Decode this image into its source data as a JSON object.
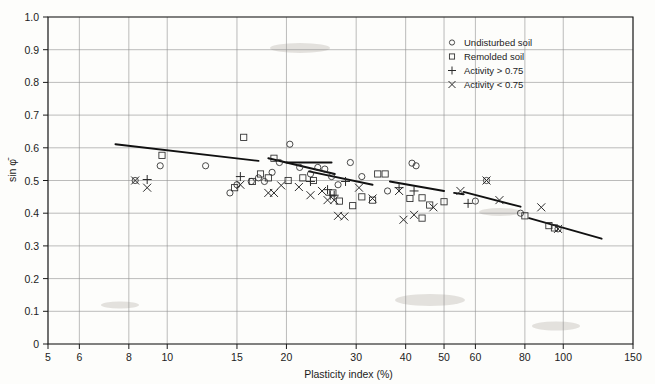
{
  "chart_data": {
    "type": "scatter",
    "title": "",
    "xlabel": "Plasticity index (%)",
    "ylabel": "sin φ̄",
    "xscale": "log",
    "xlim": [
      5,
      150
    ],
    "ylim": [
      0,
      1.0
    ],
    "grid": true,
    "xticks": [
      5,
      6,
      8,
      10,
      15,
      20,
      30,
      40,
      50,
      60,
      80,
      100,
      150
    ],
    "xticklabels": [
      "5",
      "6",
      "8",
      "10",
      "15",
      "20",
      "30",
      "40",
      "50",
      "60",
      "80",
      "100",
      "150"
    ],
    "yticks": [
      0,
      0.1,
      0.2,
      0.3,
      0.4,
      0.5,
      0.6,
      0.7,
      0.8,
      0.9,
      1.0
    ],
    "yticklabels": [
      "0",
      "0.1",
      "0.2",
      "0.3",
      "0.4",
      "0.5",
      "0.6",
      "0.7",
      "0.8",
      "0.9",
      "1.0"
    ],
    "legend_position": "upper right",
    "legend": [
      {
        "marker": "circle",
        "label": "Undisturbed soil"
      },
      {
        "marker": "square",
        "label": "Remolded soil"
      },
      {
        "marker": "plus",
        "label": "Activity > 0.75"
      },
      {
        "marker": "cross",
        "label": "Activity < 0.75"
      }
    ],
    "series": [
      {
        "name": "Undisturbed soil",
        "marker": "circle",
        "points": [
          [
            8.3,
            0.5
          ],
          [
            9.6,
            0.545
          ],
          [
            12.5,
            0.545
          ],
          [
            14.4,
            0.462
          ],
          [
            15.0,
            0.487
          ],
          [
            16.3,
            0.497
          ],
          [
            17.0,
            0.508
          ],
          [
            17.6,
            0.497
          ],
          [
            18.4,
            0.525
          ],
          [
            19.2,
            0.555
          ],
          [
            20.4,
            0.611
          ],
          [
            21.6,
            0.54
          ],
          [
            23.0,
            0.52
          ],
          [
            24.0,
            0.54
          ],
          [
            25.0,
            0.535
          ],
          [
            26.0,
            0.512
          ],
          [
            27.0,
            0.487
          ],
          [
            29.0,
            0.555
          ],
          [
            31.0,
            0.512
          ],
          [
            36.0,
            0.468
          ],
          [
            41.5,
            0.553
          ],
          [
            42.5,
            0.545
          ],
          [
            60.0,
            0.437
          ],
          [
            64.0,
            0.5
          ],
          [
            78.0,
            0.4
          ],
          [
            97.0,
            0.352
          ]
        ]
      },
      {
        "name": "Remolded soil",
        "marker": "square",
        "points": [
          [
            9.7,
            0.577
          ],
          [
            14.8,
            0.478
          ],
          [
            15.6,
            0.632
          ],
          [
            16.4,
            0.497
          ],
          [
            17.2,
            0.52
          ],
          [
            18.0,
            0.508
          ],
          [
            18.6,
            0.568
          ],
          [
            20.2,
            0.5
          ],
          [
            22.0,
            0.508
          ],
          [
            23.4,
            0.5
          ],
          [
            26.2,
            0.462
          ],
          [
            27.2,
            0.437
          ],
          [
            29.4,
            0.423
          ],
          [
            31.0,
            0.45
          ],
          [
            33.0,
            0.44
          ],
          [
            34.0,
            0.52
          ],
          [
            35.5,
            0.52
          ],
          [
            41.0,
            0.445
          ],
          [
            44.0,
            0.447
          ],
          [
            46.0,
            0.425
          ],
          [
            44.0,
            0.385
          ],
          [
            50.0,
            0.435
          ],
          [
            80.0,
            0.392
          ],
          [
            92.0,
            0.362
          ],
          [
            95.0,
            0.355
          ]
        ]
      },
      {
        "name": "Activity > 0.75",
        "marker": "plus",
        "points": [
          [
            8.9,
            0.503
          ],
          [
            15.3,
            0.512
          ],
          [
            23.0,
            0.497
          ],
          [
            25.4,
            0.472
          ],
          [
            25.8,
            0.455
          ],
          [
            26.4,
            0.455
          ],
          [
            28.2,
            0.497
          ],
          [
            38.5,
            0.478
          ],
          [
            42.0,
            0.468
          ],
          [
            57.5,
            0.43
          ]
        ]
      },
      {
        "name": "Activity < 0.75",
        "marker": "cross",
        "points": [
          [
            8.3,
            0.5
          ],
          [
            8.9,
            0.478
          ],
          [
            15.3,
            0.487
          ],
          [
            18.0,
            0.462
          ],
          [
            18.6,
            0.462
          ],
          [
            19.4,
            0.485
          ],
          [
            21.5,
            0.48
          ],
          [
            23.0,
            0.455
          ],
          [
            24.6,
            0.468
          ],
          [
            25.4,
            0.44
          ],
          [
            26.4,
            0.44
          ],
          [
            27.0,
            0.392
          ],
          [
            28.0,
            0.39
          ],
          [
            30.5,
            0.478
          ],
          [
            33.0,
            0.445
          ],
          [
            38.5,
            0.468
          ],
          [
            39.5,
            0.38
          ],
          [
            42.0,
            0.395
          ],
          [
            47.0,
            0.418
          ],
          [
            55.0,
            0.468
          ],
          [
            64.0,
            0.5
          ],
          [
            69.0,
            0.44
          ],
          [
            88.0,
            0.418
          ],
          [
            97.0,
            0.352
          ]
        ]
      }
    ],
    "trend_segments": [
      {
        "x": [
          7.4,
          17.0
        ],
        "y": [
          0.611,
          0.56
        ],
        "style": "solid"
      },
      {
        "x": [
          18.0,
          26.5
        ],
        "y": [
          0.568,
          0.52
        ],
        "style": "solid"
      },
      {
        "x": [
          20.0,
          26.0
        ],
        "y": [
          0.555,
          0.555
        ],
        "style": "solid"
      },
      {
        "x": [
          22.8,
          33.0
        ],
        "y": [
          0.528,
          0.487
        ],
        "style": "solid"
      },
      {
        "x": [
          36.5,
          50.0
        ],
        "y": [
          0.497,
          0.468
        ],
        "style": "solid"
      },
      {
        "x": [
          53.0,
          56.0
        ],
        "y": [
          0.462,
          0.458
        ],
        "style": "solid"
      },
      {
        "x": [
          56.0,
          78.0
        ],
        "y": [
          0.465,
          0.42
        ],
        "style": "solid"
      },
      {
        "x": [
          82.0,
          125.0
        ],
        "y": [
          0.385,
          0.322
        ],
        "style": "solid"
      }
    ]
  }
}
